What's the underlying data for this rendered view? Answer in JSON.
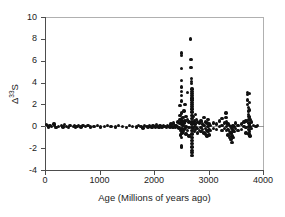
{
  "figure": {
    "background": "#ffffff",
    "marker_color": "#111111",
    "axis_color": "#4d4d4d"
  },
  "chart_data": {
    "type": "scatter",
    "title": "",
    "xlabel": "Age (Millions of years ago)",
    "ylabel": "Δ33S",
    "ylabel_base": "Δ",
    "ylabel_sup": "33",
    "ylabel_tail": "S",
    "xlim": [
      0,
      4000
    ],
    "ylim": [
      -4,
      10
    ],
    "xticks": [
      0,
      1000,
      2000,
      3000,
      4000
    ],
    "xticklabels": [
      "0",
      "1000",
      "2000",
      "3000",
      "4000"
    ],
    "yticks": [
      -4,
      -2,
      0,
      2,
      4,
      6,
      8,
      10
    ],
    "yticklabels": [
      "-4",
      "-2",
      "0",
      "2",
      "4",
      "6",
      "8",
      "10"
    ],
    "grid": false,
    "legend": null,
    "marker": "filled-circle",
    "series": [
      {
        "name": "Δ33S measurements",
        "points": [
          [
            30,
            0.15
          ],
          [
            45,
            0.05
          ],
          [
            60,
            -0.05
          ],
          [
            95,
            0.1
          ],
          [
            120,
            0.0
          ],
          [
            165,
            0.2
          ],
          [
            175,
            0.05
          ],
          [
            200,
            -0.1
          ],
          [
            245,
            0.0
          ],
          [
            300,
            0.05
          ],
          [
            330,
            -0.05
          ],
          [
            360,
            0.15
          ],
          [
            395,
            0.0
          ],
          [
            430,
            -0.1
          ],
          [
            455,
            0.05
          ],
          [
            520,
            0.0
          ],
          [
            545,
            0.1
          ],
          [
            565,
            -0.05
          ],
          [
            590,
            0.0
          ],
          [
            620,
            0.05
          ],
          [
            660,
            -0.05
          ],
          [
            700,
            0.1
          ],
          [
            745,
            0.0
          ],
          [
            790,
            0.05
          ],
          [
            840,
            -0.05
          ],
          [
            900,
            0.0
          ],
          [
            960,
            0.05
          ],
          [
            1020,
            -0.05
          ],
          [
            1090,
            0.0
          ],
          [
            1150,
            0.1
          ],
          [
            1210,
            0.0
          ],
          [
            1290,
            -0.05
          ],
          [
            1350,
            0.05
          ],
          [
            1420,
            0.0
          ],
          [
            1490,
            -0.1
          ],
          [
            1555,
            0.05
          ],
          [
            1610,
            0.0
          ],
          [
            1680,
            -0.05
          ],
          [
            1720,
            0.1
          ],
          [
            1760,
            0.0
          ],
          [
            1800,
            -0.15
          ],
          [
            1830,
            0.05
          ],
          [
            1860,
            0.0
          ],
          [
            1890,
            -0.05
          ],
          [
            1915,
            0.1
          ],
          [
            1940,
            0.0
          ],
          [
            1965,
            -0.1
          ],
          [
            1985,
            0.05
          ],
          [
            2005,
            0.0
          ],
          [
            2025,
            -0.05
          ],
          [
            2050,
            0.15
          ],
          [
            2070,
            0.0
          ],
          [
            2090,
            -0.1
          ],
          [
            2110,
            0.05
          ],
          [
            2130,
            0.0
          ],
          [
            2150,
            -0.05
          ],
          [
            2175,
            0.1
          ],
          [
            2200,
            0.0
          ],
          [
            2225,
            -0.1
          ],
          [
            2250,
            0.05
          ],
          [
            2270,
            0.0
          ],
          [
            2290,
            -0.05
          ],
          [
            2310,
            0.2
          ],
          [
            2330,
            0.0
          ],
          [
            2345,
            -0.1
          ],
          [
            2360,
            0.3
          ],
          [
            2375,
            0.05
          ],
          [
            2390,
            -0.05
          ],
          [
            2405,
            0.1
          ],
          [
            2420,
            0.0
          ],
          [
            2440,
            0.4
          ],
          [
            2455,
            -0.15
          ],
          [
            2470,
            0.25
          ],
          [
            2480,
            0.6
          ],
          [
            2480,
            1.0
          ],
          [
            2480,
            1.9
          ],
          [
            2490,
            0.3
          ],
          [
            2490,
            -0.4
          ],
          [
            2490,
            -0.8
          ],
          [
            2500,
            6.7
          ],
          [
            2500,
            6.5
          ],
          [
            2500,
            5.3
          ],
          [
            2500,
            4.2
          ],
          [
            2500,
            3.6
          ],
          [
            2500,
            3.2
          ],
          [
            2500,
            2.8
          ],
          [
            2500,
            2.3
          ],
          [
            2500,
            1.2
          ],
          [
            2500,
            0.7
          ],
          [
            2500,
            0.2
          ],
          [
            2500,
            -0.3
          ],
          [
            2500,
            -1.0
          ],
          [
            2500,
            -1.8
          ],
          [
            2500,
            -1.9
          ],
          [
            2515,
            0.5
          ],
          [
            2515,
            -0.2
          ],
          [
            2515,
            -0.6
          ],
          [
            2530,
            0.8
          ],
          [
            2530,
            0.1
          ],
          [
            2530,
            -0.5
          ],
          [
            2550,
            1.4
          ],
          [
            2550,
            0.3
          ],
          [
            2550,
            -0.3
          ],
          [
            2570,
            2.0
          ],
          [
            2570,
            0.5
          ],
          [
            2570,
            -0.2
          ],
          [
            2590,
            0.9
          ],
          [
            2590,
            0.0
          ],
          [
            2590,
            -0.7
          ],
          [
            2610,
            3.1
          ],
          [
            2610,
            0.6
          ],
          [
            2610,
            -0.4
          ],
          [
            2640,
            0.4
          ],
          [
            2640,
            -0.1
          ],
          [
            2640,
            -0.9
          ],
          [
            2665,
            8.0
          ],
          [
            2680,
            6.1
          ],
          [
            2680,
            5.4
          ],
          [
            2690,
            4.4
          ],
          [
            2690,
            4.1
          ],
          [
            2690,
            3.9
          ],
          [
            2700,
            3.4
          ],
          [
            2700,
            3.2
          ],
          [
            2700,
            3.0
          ],
          [
            2700,
            2.8
          ],
          [
            2700,
            2.6
          ],
          [
            2700,
            2.4
          ],
          [
            2700,
            2.2
          ],
          [
            2700,
            2.0
          ],
          [
            2700,
            1.8
          ],
          [
            2700,
            1.6
          ],
          [
            2700,
            1.3
          ],
          [
            2700,
            1.0
          ],
          [
            2700,
            0.7
          ],
          [
            2700,
            0.4
          ],
          [
            2700,
            0.2
          ],
          [
            2700,
            -0.1
          ],
          [
            2700,
            -0.4
          ],
          [
            2700,
            -0.7
          ],
          [
            2700,
            -1.0
          ],
          [
            2700,
            -1.3
          ],
          [
            2700,
            -1.6
          ],
          [
            2700,
            -1.9
          ],
          [
            2700,
            -2.2
          ],
          [
            2700,
            -2.4
          ],
          [
            2700,
            -2.7
          ],
          [
            2720,
            0.9
          ],
          [
            2720,
            0.3
          ],
          [
            2720,
            -0.2
          ],
          [
            2740,
            0.5
          ],
          [
            2740,
            0.0
          ],
          [
            2740,
            -0.5
          ],
          [
            2760,
            1.1
          ],
          [
            2760,
            0.2
          ],
          [
            2760,
            -0.3
          ],
          [
            2780,
            0.6
          ],
          [
            2780,
            -0.1
          ],
          [
            2800,
            0.4
          ],
          [
            2800,
            -0.2
          ],
          [
            2800,
            -0.6
          ],
          [
            2830,
            0.3
          ],
          [
            2830,
            -0.4
          ],
          [
            2860,
            0.5
          ],
          [
            2860,
            -0.1
          ],
          [
            2860,
            -0.5
          ],
          [
            2890,
            0.2
          ],
          [
            2890,
            -0.3
          ],
          [
            2920,
            0.8
          ],
          [
            2920,
            0.1
          ],
          [
            2920,
            -0.6
          ],
          [
            2950,
            0.4
          ],
          [
            2950,
            -0.2
          ],
          [
            2950,
            -0.7
          ],
          [
            2970,
            0.3
          ],
          [
            2970,
            -0.4
          ],
          [
            2970,
            -0.9
          ],
          [
            2990,
            0.6
          ],
          [
            2990,
            0.0
          ],
          [
            2990,
            -0.5
          ],
          [
            3010,
            0.2
          ],
          [
            3010,
            -0.3
          ],
          [
            3010,
            -0.8
          ],
          [
            3040,
            0.1
          ],
          [
            3040,
            -0.4
          ],
          [
            3090,
            0.3
          ],
          [
            3090,
            -0.2
          ],
          [
            3150,
            0.2
          ],
          [
            3150,
            -0.3
          ],
          [
            3200,
            0.5
          ],
          [
            3200,
            0.0
          ],
          [
            3250,
            0.7
          ],
          [
            3250,
            0.1
          ],
          [
            3250,
            -0.4
          ],
          [
            3290,
            0.3
          ],
          [
            3290,
            -0.2
          ],
          [
            3320,
            1.2
          ],
          [
            3320,
            0.8
          ],
          [
            3330,
            0.4
          ],
          [
            3330,
            0.0
          ],
          [
            3330,
            -0.4
          ],
          [
            3360,
            0.2
          ],
          [
            3360,
            -0.3
          ],
          [
            3360,
            -0.8
          ],
          [
            3390,
            0.1
          ],
          [
            3390,
            -0.5
          ],
          [
            3390,
            -1.0
          ],
          [
            3410,
            0.0
          ],
          [
            3410,
            -0.6
          ],
          [
            3410,
            -1.2
          ],
          [
            3430,
            -0.2
          ],
          [
            3430,
            -0.9
          ],
          [
            3430,
            -1.5
          ],
          [
            3450,
            0.1
          ],
          [
            3450,
            -0.4
          ],
          [
            3450,
            -1.0
          ],
          [
            3470,
            0.0
          ],
          [
            3470,
            -0.5
          ],
          [
            3500,
            0.3
          ],
          [
            3500,
            -0.2
          ],
          [
            3540,
            0.1
          ],
          [
            3540,
            -0.4
          ],
          [
            3600,
            0.2
          ],
          [
            3600,
            -0.3
          ],
          [
            3650,
            0.4
          ],
          [
            3650,
            0.0
          ],
          [
            3690,
            0.5
          ],
          [
            3690,
            -0.1
          ],
          [
            3690,
            -0.6
          ],
          [
            3710,
            3.1
          ],
          [
            3710,
            2.9
          ],
          [
            3720,
            2.4
          ],
          [
            3720,
            2.0
          ],
          [
            3730,
            1.7
          ],
          [
            3730,
            1.4
          ],
          [
            3730,
            1.1
          ],
          [
            3740,
            0.9
          ],
          [
            3740,
            0.6
          ],
          [
            3740,
            0.3
          ],
          [
            3745,
            0.0
          ],
          [
            3745,
            -0.3
          ],
          [
            3745,
            -0.7
          ],
          [
            3750,
            3.0
          ],
          [
            3750,
            2.2
          ],
          [
            3750,
            1.5
          ],
          [
            3755,
            0.8
          ],
          [
            3755,
            0.2
          ],
          [
            3755,
            -0.5
          ],
          [
            3760,
            -0.9
          ],
          [
            3770,
            0.6
          ],
          [
            3770,
            0.0
          ],
          [
            3790,
            0.4
          ],
          [
            3790,
            -0.2
          ],
          [
            3820,
            0.1
          ],
          [
            3870,
            0.0
          ],
          [
            3900,
            0.1
          ]
        ]
      }
    ]
  }
}
